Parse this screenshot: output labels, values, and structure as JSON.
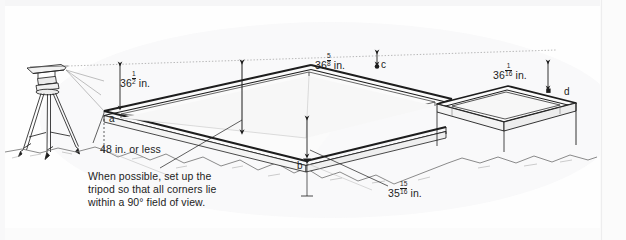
{
  "figure": {
    "kind": "technical-illustration",
    "background_color": "#fefefe",
    "ink_color": "#1d1d1d"
  },
  "dimensions": [
    {
      "id": "left-height",
      "whole": "36",
      "fraction_numerator": "1",
      "fraction_denominator": "2",
      "unit": "in.",
      "measures": "height from instrument sight line down to corner a"
    },
    {
      "id": "center-height",
      "whole": "36",
      "fraction_numerator": "5",
      "fraction_denominator": "8",
      "unit": "in.",
      "measures": "height from sight line down to corner c"
    },
    {
      "id": "right-height",
      "whole": "36",
      "fraction_numerator": "1",
      "fraction_denominator": "16",
      "unit": "in.",
      "measures": "height from sight line down to corner d"
    },
    {
      "id": "front-height",
      "whole": "35",
      "fraction_numerator": "15",
      "fraction_denominator": "16",
      "unit": "in.",
      "measures": "height from sight line down to corner b"
    }
  ],
  "plain_labels": {
    "tripod_distance": "48 in. or less"
  },
  "corner_markers": [
    {
      "id": "a",
      "label": "a"
    },
    {
      "id": "b",
      "label": "b"
    },
    {
      "id": "c",
      "label": "c"
    },
    {
      "id": "d",
      "label": "d"
    }
  ],
  "caption": {
    "line1": "When possible, set up the",
    "line2": "tripod so that all corners lie",
    "line3": "within a 90° field of view."
  },
  "icons": {
    "tripod": "tripod-level-icon",
    "arrow_up": "arrow-up-icon",
    "arrow_down": "arrow-down-icon"
  }
}
